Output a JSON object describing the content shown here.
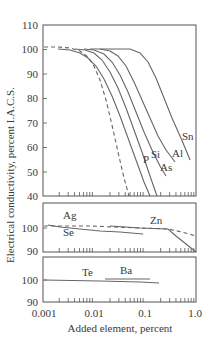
{
  "chart_data": [
    {
      "type": "line",
      "panel": "top",
      "title": "",
      "xlabel": "Added element, percent",
      "ylabel": "Electrical conductivity, percent I.A.C.S.",
      "xscale": "log",
      "xlim": [
        0.001,
        1.0
      ],
      "ylim": [
        40,
        110
      ],
      "yticks": [
        40,
        50,
        60,
        70,
        80,
        90,
        100,
        110
      ],
      "grid": false,
      "series": [
        {
          "name": "Sn",
          "style": "solid",
          "x": [
            0.02,
            0.05,
            0.1,
            0.2,
            0.4,
            0.7,
            0.9
          ],
          "y": [
            100,
            100,
            99,
            94,
            82,
            68,
            58
          ]
        },
        {
          "name": "Al",
          "style": "solid",
          "x": [
            0.015,
            0.03,
            0.06,
            0.12,
            0.25,
            0.45,
            0.65
          ],
          "y": [
            100,
            99.5,
            97,
            90,
            78,
            67,
            58
          ]
        },
        {
          "name": "As",
          "style": "solid",
          "x": [
            0.01,
            0.02,
            0.04,
            0.08,
            0.15,
            0.3,
            0.45
          ],
          "y": [
            100,
            99,
            96,
            88,
            76,
            62,
            55
          ]
        },
        {
          "name": "Si",
          "style": "solid",
          "x": [
            0.005,
            0.01,
            0.02,
            0.04,
            0.08,
            0.15,
            0.3
          ],
          "y": [
            100,
            99.5,
            97,
            90,
            77,
            62,
            45
          ]
        },
        {
          "name": "P",
          "style": "solid",
          "x": [
            0.002,
            0.005,
            0.01,
            0.02,
            0.04,
            0.08,
            0.15,
            0.25
          ],
          "y": [
            100,
            99,
            97,
            92,
            82,
            67,
            52,
            40
          ]
        },
        {
          "name": "(dashed reference)",
          "style": "dashed",
          "x": [
            0.001,
            0.003,
            0.006,
            0.01,
            0.02,
            0.04,
            0.08,
            0.14
          ],
          "y": [
            101,
            101,
            99,
            96,
            87,
            72,
            55,
            40
          ]
        }
      ],
      "labels": [
        "Sn",
        "Al",
        "As",
        "Si",
        "P"
      ]
    },
    {
      "type": "line",
      "panel": "middle",
      "xscale": "log",
      "xlim": [
        0.001,
        1.0
      ],
      "ylim": [
        90,
        110
      ],
      "yticks": [
        90,
        100
      ],
      "series": [
        {
          "name": "Ag",
          "style": "solid",
          "x": [
            0.001,
            0.003,
            0.01,
            0.1
          ],
          "y": [
            101,
            100,
            99,
            96.5
          ]
        },
        {
          "name": "Se",
          "style": "solid",
          "x": [
            0.001,
            0.002,
            0.004
          ],
          "y": [
            100,
            99.5,
            99
          ]
        },
        {
          "name": "Zn",
          "style": "solid",
          "x": [
            0.02,
            0.1,
            0.25,
            0.5,
            1.0
          ],
          "y": [
            100.5,
            99.5,
            99,
            95,
            89
          ]
        },
        {
          "name": "(dashed reference)",
          "style": "dashed",
          "x": [
            0.001,
            0.01,
            0.1,
            0.25,
            0.6,
            1.0
          ],
          "y": [
            101,
            100.5,
            99.5,
            99,
            96,
            94
          ]
        }
      ],
      "labels": [
        "Ag",
        "Se",
        "Zn"
      ]
    },
    {
      "type": "line",
      "panel": "bottom",
      "xscale": "log",
      "xlim": [
        0.001,
        1.0
      ],
      "ylim": [
        90,
        110
      ],
      "yticks": [
        90,
        100
      ],
      "xticks": [
        "0.001",
        "0.01",
        "0.1",
        "1.0"
      ],
      "series": [
        {
          "name": "Te",
          "style": "solid",
          "x": [
            0.001,
            0.01,
            0.1,
            0.2
          ],
          "y": [
            100,
            99.5,
            98.7,
            98.5
          ]
        },
        {
          "name": "Ba",
          "style": "solid",
          "x": [
            0.02,
            0.1
          ],
          "y": [
            100.8,
            100.8
          ]
        }
      ],
      "labels": [
        "Te",
        "Ba"
      ]
    }
  ],
  "axes": {
    "xlabel": "Added element, percent",
    "ylabel": "Electrical conductivity, percent I.A.C.S.",
    "xtick_labels": [
      "0.001",
      "0.01",
      "0.1",
      "1.0"
    ],
    "top_ytick_labels": [
      "110",
      "100",
      "90",
      "80",
      "70",
      "60",
      "50",
      "40"
    ],
    "mid_ytick_labels": [
      "100",
      "90"
    ],
    "bot_ytick_labels": [
      "100",
      "90"
    ]
  },
  "curve_labels": {
    "sn": "Sn",
    "al": "Al",
    "as": "As",
    "si": "Si",
    "p": "P",
    "ag": "Ag",
    "se": "Se",
    "zn": "Zn",
    "te": "Te",
    "ba": "Ba"
  }
}
